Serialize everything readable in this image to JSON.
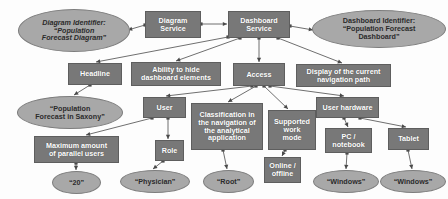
{
  "diagram": {
    "type": "node-link-diagram",
    "colors": {
      "rect_fill": "#787878",
      "rect_stroke": "#5e5e5e",
      "ellipse_fill": "#a8a8a8",
      "ellipse_stroke": "#7d7d7d",
      "edge": "#6f6f6f",
      "background": "#fdfdfd",
      "rect_text": "#ffffff",
      "ellipse_text": "#2b2b2b"
    },
    "nodes": [
      {
        "id": "diagram-identifier",
        "shape": "ellipse",
        "italic": true,
        "label": "Diagram Identifier:\n“Population\nForecast Diagram”",
        "x": 18,
        "y": 9,
        "w": 112,
        "h": 43
      },
      {
        "id": "diagram-service",
        "shape": "rect",
        "label": "Diagram\nService",
        "x": 145,
        "y": 11,
        "w": 56,
        "h": 27
      },
      {
        "id": "dashboard-service",
        "shape": "rect",
        "label": "Dashboard\nService",
        "x": 228,
        "y": 11,
        "w": 62,
        "h": 27
      },
      {
        "id": "dashboard-identifier",
        "shape": "ellipse",
        "italic": false,
        "label": "Dashboard Identifier:\n“Population Forecast\nDashboard”",
        "x": 312,
        "y": 10,
        "w": 134,
        "h": 38
      },
      {
        "id": "headline",
        "shape": "rect",
        "label": "Headline",
        "x": 68,
        "y": 63,
        "w": 54,
        "h": 22
      },
      {
        "id": "ability-to-hide-dashboard-elements",
        "shape": "rect",
        "label": "Ability to hide\ndashboard elements",
        "x": 131,
        "y": 62,
        "w": 90,
        "h": 24
      },
      {
        "id": "access",
        "shape": "rect",
        "label": "Access",
        "x": 233,
        "y": 63,
        "w": 52,
        "h": 23
      },
      {
        "id": "display-of-the-current-navigation-path",
        "shape": "rect",
        "label": "Display of the current\nnavigation path",
        "x": 296,
        "y": 64,
        "w": 95,
        "h": 23
      },
      {
        "id": "population-forecast-in-saxony",
        "shape": "ellipse",
        "italic": false,
        "label": "“Population\nForecast in Saxony”",
        "x": 17,
        "y": 96,
        "w": 106,
        "h": 33
      },
      {
        "id": "user",
        "shape": "rect",
        "label": "User",
        "x": 143,
        "y": 97,
        "w": 43,
        "h": 21
      },
      {
        "id": "classification-in-the-navigation-of-the-analytical-application",
        "shape": "rect",
        "label": "Classification in\nthe navigation of\nthe analytical\napplication",
        "x": 191,
        "y": 103,
        "w": 72,
        "h": 47
      },
      {
        "id": "supported-work-mode",
        "shape": "rect",
        "label": "Supported\nwork\nmode",
        "x": 268,
        "y": 110,
        "w": 48,
        "h": 40
      },
      {
        "id": "user-hardware",
        "shape": "rect",
        "label": "User hardware",
        "x": 316,
        "y": 97,
        "w": 63,
        "h": 21
      },
      {
        "id": "maximum-amount-of-parallel-users",
        "shape": "rect",
        "label": "Maximum amount\nof parallel users",
        "x": 34,
        "y": 136,
        "w": 85,
        "h": 27
      },
      {
        "id": "role",
        "shape": "rect",
        "label": "Role",
        "x": 155,
        "y": 140,
        "w": 29,
        "h": 21
      },
      {
        "id": "pc-notebook",
        "shape": "rect",
        "label": "PC /\nnotebook",
        "x": 325,
        "y": 128,
        "w": 47,
        "h": 25
      },
      {
        "id": "tablet",
        "shape": "rect",
        "label": "Tablet",
        "x": 388,
        "y": 128,
        "w": 41,
        "h": 22
      },
      {
        "id": "online-offline",
        "shape": "rect",
        "label": "Online /\noffline",
        "x": 264,
        "y": 157,
        "w": 37,
        "h": 26
      },
      {
        "id": "value-20",
        "shape": "ellipse",
        "italic": false,
        "label": "“20”",
        "x": 52,
        "y": 171,
        "w": 49,
        "h": 23
      },
      {
        "id": "value-physician",
        "shape": "ellipse",
        "italic": false,
        "label": "“Physician”",
        "x": 120,
        "y": 170,
        "w": 70,
        "h": 23
      },
      {
        "id": "value-root",
        "shape": "ellipse",
        "italic": false,
        "label": "“Root”",
        "x": 203,
        "y": 170,
        "w": 51,
        "h": 23
      },
      {
        "id": "value-windows-pc",
        "shape": "ellipse",
        "italic": false,
        "label": "“Windows”",
        "x": 313,
        "y": 170,
        "w": 66,
        "h": 23
      },
      {
        "id": "value-windows-tablet",
        "shape": "ellipse",
        "italic": false,
        "label": "“Windows”",
        "x": 380,
        "y": 170,
        "w": 66,
        "h": 23
      }
    ],
    "edges": [
      {
        "from": "diagram-service",
        "to": "diagram-identifier",
        "x1": 145,
        "y1": 25,
        "x2": 128,
        "y2": 30
      },
      {
        "from": "diagram-service",
        "to": "dashboard-service",
        "x1": 201,
        "y1": 24,
        "x2": 227,
        "y2": 24
      },
      {
        "from": "dashboard-service",
        "to": "dashboard-identifier",
        "x1": 290,
        "y1": 26,
        "x2": 313,
        "y2": 30
      },
      {
        "from": "dashboard-service",
        "to": "headline",
        "x1": 228,
        "y1": 37,
        "x2": 96,
        "y2": 62
      },
      {
        "from": "dashboard-service",
        "to": "ability-to-hide-dashboard-elements",
        "x1": 240,
        "y1": 38,
        "x2": 176,
        "y2": 61
      },
      {
        "from": "dashboard-service",
        "to": "access",
        "x1": 259,
        "y1": 38,
        "x2": 259,
        "y2": 62
      },
      {
        "from": "dashboard-service",
        "to": "display-of-the-current-navigation-path",
        "x1": 278,
        "y1": 38,
        "x2": 342,
        "y2": 63
      },
      {
        "from": "headline",
        "to": "population-forecast-in-saxony",
        "x1": 90,
        "y1": 85,
        "x2": 74,
        "y2": 95
      },
      {
        "from": "access",
        "to": "user",
        "x1": 252,
        "y1": 86,
        "x2": 166,
        "y2": 96
      },
      {
        "from": "access",
        "to": "classification-in-the-navigation-of-the-analytical-application",
        "x1": 256,
        "y1": 86,
        "x2": 228,
        "y2": 102
      },
      {
        "from": "access",
        "to": "supported-work-mode",
        "x1": 264,
        "y1": 86,
        "x2": 288,
        "y2": 109
      },
      {
        "from": "access",
        "to": "user-hardware",
        "x1": 270,
        "y1": 86,
        "x2": 344,
        "y2": 96
      },
      {
        "from": "user",
        "to": "maximum-amount-of-parallel-users",
        "x1": 152,
        "y1": 118,
        "x2": 86,
        "y2": 135
      },
      {
        "from": "user",
        "to": "role",
        "x1": 168,
        "y1": 118,
        "x2": 168,
        "y2": 139
      },
      {
        "from": "maximum-amount-of-parallel-users",
        "to": "value-20",
        "x1": 76,
        "y1": 163,
        "x2": 76,
        "y2": 170
      },
      {
        "from": "role",
        "to": "value-physician",
        "x1": 163,
        "y1": 161,
        "x2": 153,
        "y2": 169
      },
      {
        "from": "classification-in-the-navigation-of-the-analytical-application",
        "to": "value-root",
        "x1": 223,
        "y1": 150,
        "x2": 227,
        "y2": 169
      },
      {
        "from": "supported-work-mode",
        "to": "online-offline",
        "x1": 285,
        "y1": 150,
        "x2": 282,
        "y2": 156
      },
      {
        "from": "user-hardware",
        "to": "pc-notebook",
        "x1": 344,
        "y1": 118,
        "x2": 348,
        "y2": 127
      },
      {
        "from": "user-hardware",
        "to": "tablet",
        "x1": 360,
        "y1": 118,
        "x2": 406,
        "y2": 127
      },
      {
        "from": "pc-notebook",
        "to": "value-windows-pc",
        "x1": 347,
        "y1": 153,
        "x2": 346,
        "y2": 169
      },
      {
        "from": "tablet",
        "to": "value-windows-tablet",
        "x1": 408,
        "y1": 150,
        "x2": 412,
        "y2": 169
      }
    ]
  }
}
